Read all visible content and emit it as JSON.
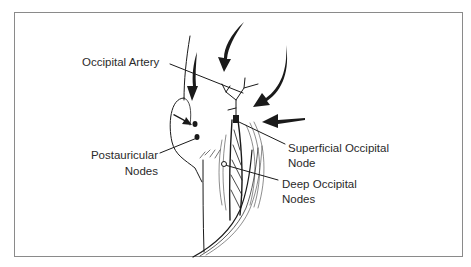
{
  "figure": {
    "labels": {
      "occipital_artery": "Occipital Artery",
      "postauricular_line1": "Postauricular",
      "postauricular_line2": "Nodes",
      "superficial_line1": "Superficial Occipital",
      "superficial_line2": "Node",
      "deep_line1": "Deep Occipital",
      "deep_line2": "Nodes"
    },
    "colors": {
      "ink": "#1a1a1a",
      "frame": "#8a8a8a",
      "background": "#ffffff"
    }
  }
}
